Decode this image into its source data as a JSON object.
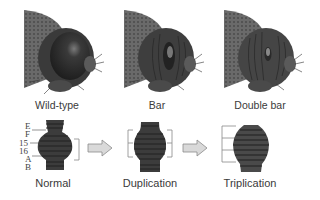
{
  "top_row": {
    "panels": [
      {
        "id": "wild-type",
        "label": "Wild-type",
        "eye": "round"
      },
      {
        "id": "bar",
        "label": "Bar",
        "eye": "narrow-bar"
      },
      {
        "id": "double-bar",
        "label": "Double bar",
        "eye": "very-narrow-bar"
      }
    ]
  },
  "bottom_row": {
    "band_labels": [
      "E",
      "F",
      "15",
      "16",
      "A",
      "B"
    ],
    "chromosomes": [
      {
        "id": "normal",
        "label": "Normal",
        "segment_copies": 1
      },
      {
        "id": "duplication",
        "label": "Duplication",
        "segment_copies": 2
      },
      {
        "id": "triplication",
        "label": "Triplication",
        "segment_copies": 3
      }
    ],
    "arrows": [
      "arrow-right",
      "arrow-right"
    ]
  },
  "colors": {
    "head_dark": "#2e2e2e",
    "head_mid": "#555555",
    "thorax": "#6a6a6a",
    "chromosome": "#3c3c3c",
    "arrow_fill": "#d9d9d9",
    "arrow_stroke": "#8a8a8a",
    "bracket": "#777777"
  }
}
